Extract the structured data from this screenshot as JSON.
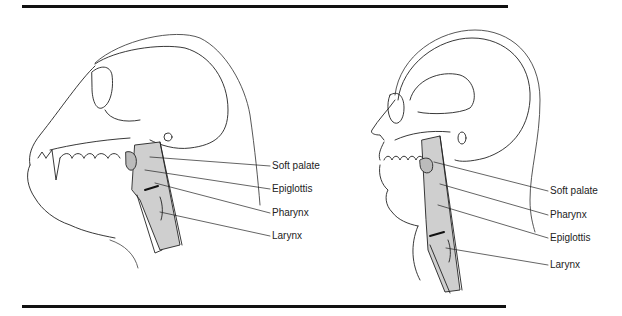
{
  "figure": {
    "left_panel": {
      "subject": "chimpanzee",
      "labels": [
        {
          "text": "Soft palate",
          "x": 272,
          "y": 160
        },
        {
          "text": "Epiglottis",
          "x": 272,
          "y": 183
        },
        {
          "text": "Pharynx",
          "x": 272,
          "y": 207
        },
        {
          "text": "Larynx",
          "x": 272,
          "y": 230
        }
      ]
    },
    "right_panel": {
      "subject": "human",
      "labels": [
        {
          "text": "Soft palate",
          "x": 550,
          "y": 185
        },
        {
          "text": "Pharynx",
          "x": 550,
          "y": 209
        },
        {
          "text": "Epiglottis",
          "x": 550,
          "y": 232
        },
        {
          "text": "Larynx",
          "x": 550,
          "y": 259
        }
      ]
    }
  }
}
